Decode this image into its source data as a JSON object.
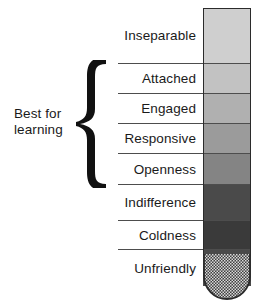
{
  "annotation": {
    "line1": "Best for",
    "line2": "learning"
  },
  "brace": {
    "icon": "curly-brace-icon",
    "spans_labels": [
      "Attached",
      "Engaged",
      "Responsive",
      "Openness"
    ]
  },
  "scale": {
    "rows": [
      {
        "label": "Inseparable",
        "color": "#cfcfcf",
        "height": 55
      },
      {
        "label": "Attached",
        "color": "#c2c2c2",
        "height": 30
      },
      {
        "label": "Engaged",
        "color": "#b0b0b0",
        "height": 30
      },
      {
        "label": "Responsive",
        "color": "#9b9b9b",
        "height": 30
      },
      {
        "label": "Openness",
        "color": "#848484",
        "height": 31
      },
      {
        "label": "Indifference",
        "color": "#4a4a4a",
        "height": 36
      },
      {
        "label": "Coldness",
        "color": "#3a3a3a",
        "height": 29
      },
      {
        "label": "Unfriendly",
        "color": "#4a4a4a",
        "height": 37
      }
    ]
  },
  "bulb": {
    "icon": "thermometer-bulb-icon",
    "fill": "#4a4a4a",
    "pattern": "stipple-dots",
    "outline": "#2b2b2b"
  },
  "colors": {
    "text": "#1a1a1a",
    "rule": "#4d4d4d",
    "outline": "#2b2b2b",
    "background": "#ffffff"
  }
}
